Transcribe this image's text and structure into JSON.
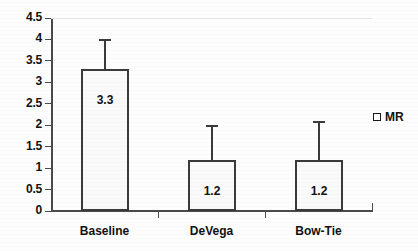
{
  "chart_data": {
    "type": "bar",
    "title": "",
    "subtitle": "",
    "xlabel": "",
    "ylabel": "",
    "categories": [
      "Baseline",
      "DeVega",
      "Bow-Tie"
    ],
    "values": [
      3.3,
      1.2,
      1.2
    ],
    "data_labels": [
      "3.3",
      "1.2",
      "1.2"
    ],
    "error_bars_upper": [
      4.0,
      2.0,
      2.1
    ],
    "series": [
      {
        "name": "MR",
        "values": [
          3.3,
          1.2,
          1.2
        ]
      }
    ],
    "ylim": [
      0,
      4.5
    ],
    "ytick_step": 0.5,
    "ytick_labels": [
      "4.5",
      "4",
      "3.5",
      "3",
      "2.5",
      "2",
      "1.5",
      "1",
      "0.5",
      "0"
    ],
    "ytick_values": [
      4.5,
      4,
      3.5,
      3,
      2.5,
      2,
      1.5,
      1,
      0.5,
      0
    ],
    "grid": false,
    "legend_position": "right",
    "legend": [
      {
        "label": "MR",
        "marker": "hollow-square",
        "fill": "#ffffff",
        "border": "#1a1a1a"
      }
    ],
    "colors": {
      "bar_fill": "#fafafa",
      "bar_border": "#3a3a3a",
      "axis": "#4a4a4a",
      "text": "#111111",
      "background": "#fdfdfd"
    }
  }
}
